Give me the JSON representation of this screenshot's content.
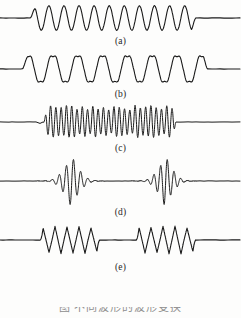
{
  "figure": {
    "kind": "scanned-figure",
    "background_color": "#fdfdfc",
    "trace_color": "#1a1a1a",
    "label_color": "#262626",
    "bottom_caption_text": "图  不同波形的波形变换",
    "panels": [
      {
        "label": "(a)",
        "name": "panel-a"
      },
      {
        "label": "(b)",
        "name": "panel-b"
      },
      {
        "label": "(c)",
        "name": "panel-c"
      },
      {
        "label": "(d)",
        "name": "panel-d"
      },
      {
        "label": "(e)",
        "name": "panel-e"
      }
    ]
  },
  "chart_data": [
    {
      "type": "line",
      "title": "(a)",
      "xlabel": "",
      "ylabel": "",
      "grid": false,
      "legend": "none",
      "description": "Flat baseline, then a uniform sinusoidal burst of about 11 cycles of constant amplitude, then flat baseline.",
      "xlim": [
        0,
        241
      ],
      "ylim": [
        -1.2,
        1.2
      ],
      "baseline_y": 0,
      "burst_start_x": 30,
      "burst_end_x": 196,
      "cycles": 11,
      "amplitude": 1.0,
      "waveform": "sine",
      "series": [
        {
          "name": "trace-a",
          "x": [
            0,
            8,
            16,
            24,
            30,
            34,
            38,
            42,
            46,
            50,
            54,
            58,
            62,
            66,
            70,
            74,
            78,
            82,
            86,
            90,
            94,
            98,
            102,
            106,
            110,
            114,
            118,
            122,
            126,
            130,
            134,
            138,
            142,
            146,
            150,
            154,
            158,
            162,
            166,
            170,
            174,
            178,
            182,
            186,
            190,
            194,
            196,
            206,
            216,
            226,
            236,
            241
          ],
          "values": [
            0,
            0,
            0,
            0,
            0,
            0.62,
            1.0,
            0.62,
            0,
            -0.62,
            -1.0,
            -0.62,
            0,
            0.62,
            1.0,
            0.62,
            0,
            -0.62,
            -1.0,
            -0.62,
            0,
            0.62,
            1.0,
            0.62,
            0,
            -0.62,
            -1.0,
            -0.62,
            0,
            0.62,
            1.0,
            0.62,
            0,
            -0.62,
            -1.0,
            -0.62,
            0,
            0.62,
            1.0,
            0.62,
            0,
            -0.62,
            -1.0,
            -0.62,
            0,
            0.5,
            0,
            0,
            0,
            0,
            0,
            0
          ]
        }
      ]
    },
    {
      "type": "line",
      "title": "(b)",
      "xlabel": "",
      "ylabel": "",
      "grid": false,
      "legend": "none",
      "description": "Flat baseline, then a burst of about 7.5 lower-frequency cycles with a small secondary ripple notched into each crest and trough, then flat baseline.",
      "xlim": [
        0,
        241
      ],
      "ylim": [
        -1.25,
        1.25
      ],
      "baseline_y": 0,
      "burst_start_x": 22,
      "burst_end_x": 208,
      "cycles": 7.5,
      "amplitude": 1.0,
      "waveform": "sine-with-ripple",
      "ripple_amplitude": 0.18,
      "ripple_multiplier": 3
    },
    {
      "type": "line",
      "title": "(c)",
      "xlabel": "",
      "ylabel": "",
      "grid": false,
      "legend": "none",
      "description": "Flat baseline, then a dense high-frequency burst of roughly 25 cycles with slightly irregular spiky amplitude, then flat baseline.",
      "xlim": [
        0,
        241
      ],
      "ylim": [
        -1.3,
        1.3
      ],
      "baseline_y": 0,
      "burst_start_x": 44,
      "burst_end_x": 176,
      "cycles": 25,
      "amplitude": 1.0,
      "waveform": "dense-spiky-sine"
    },
    {
      "type": "line",
      "title": "(d)",
      "xlabel": "",
      "ylabel": "",
      "grid": false,
      "legend": "none",
      "description": "Two separated wave packets. Each packet grows from the baseline, peaks with a tall narrow central spike, then decays back to the baseline.",
      "xlim": [
        0,
        241
      ],
      "ylim": [
        -1.35,
        1.35
      ],
      "baseline_y": 0,
      "packets": [
        {
          "start_x": 36,
          "center_x": 70,
          "end_x": 104,
          "peak_amplitude": 1.0
        },
        {
          "start_x": 132,
          "center_x": 163,
          "end_x": 196,
          "peak_amplitude": 1.0
        }
      ],
      "waveform": "modulated-wave-packet"
    },
    {
      "type": "line",
      "title": "(e)",
      "xlabel": "",
      "ylabel": "",
      "grid": false,
      "legend": "none",
      "description": "Two separated bursts of about five sharp triangular (sawtooth-like) cycles each, separated by a flat baseline segment.",
      "xlim": [
        0,
        241
      ],
      "ylim": [
        -1.2,
        1.2
      ],
      "baseline_y": 0,
      "bursts": [
        {
          "start_x": 40,
          "end_x": 100,
          "cycles": 5,
          "amplitude": 1.0
        },
        {
          "start_x": 136,
          "end_x": 196,
          "cycles": 5,
          "amplitude": 1.0
        }
      ],
      "waveform": "triangular"
    }
  ]
}
